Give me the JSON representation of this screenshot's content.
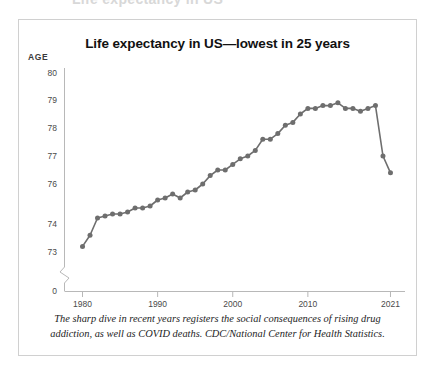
{
  "bleed": {
    "clipped_heading": "Life expectancy in US"
  },
  "figure": {
    "title": "Life expectancy in US—lowest in 25 years",
    "axis_unit_label": "AGE",
    "caption": "The sharp dive in recent years registers the social consequences of rising drug addiction, as well as COVID deaths. CDC/National Center for Health Statistics."
  },
  "colors": {
    "line": "#6e6e6e",
    "marker": "#6e6e6e",
    "axis": "#b8b8b8",
    "frame": "#d0d0d0",
    "title_text": "#111111",
    "tick_text": "#4a4a4a"
  },
  "chart_data": {
    "type": "line",
    "title": "Life expectancy in US—lowest in 25 years",
    "xlabel": "",
    "ylabel": "AGE",
    "ylim": [
      72.8,
      80.2
    ],
    "xlim": [
      1979,
      2022
    ],
    "grid": false,
    "legend": null,
    "axis_break": true,
    "axis_break_note": "y-axis broken between 0 and 73",
    "y_tick_labels": [
      "80",
      "79",
      "78",
      "77",
      "76",
      "74",
      "73",
      "0"
    ],
    "y_tick_values": [
      80,
      79,
      78,
      77,
      76,
      74,
      73,
      0
    ],
    "x_tick_labels": [
      "1980",
      "1990",
      "2000",
      "2010",
      "2021"
    ],
    "x_tick_values": [
      1980,
      1990,
      2000,
      2010,
      2021
    ],
    "series": [
      {
        "name": "US life expectancy at birth (years)",
        "x": [
          1980,
          1981,
          1982,
          1983,
          1984,
          1985,
          1986,
          1987,
          1988,
          1989,
          1990,
          1991,
          1992,
          1993,
          1994,
          1995,
          1996,
          1997,
          1998,
          1999,
          2000,
          2001,
          2002,
          2003,
          2004,
          2005,
          2006,
          2007,
          2008,
          2009,
          2010,
          2011,
          2012,
          2013,
          2014,
          2015,
          2016,
          2017,
          2018,
          2019,
          2020,
          2021
        ],
        "values": [
          73.2,
          73.6,
          74.3,
          74.4,
          74.5,
          74.5,
          74.6,
          74.8,
          74.8,
          74.9,
          75.2,
          75.3,
          75.5,
          75.3,
          75.6,
          75.7,
          76.0,
          76.3,
          76.5,
          76.5,
          76.7,
          76.9,
          77.0,
          77.2,
          77.6,
          77.6,
          77.8,
          78.1,
          78.2,
          78.5,
          78.7,
          78.7,
          78.8,
          78.8,
          78.9,
          78.7,
          78.7,
          78.6,
          78.7,
          78.8,
          77.0,
          76.4
        ]
      }
    ]
  }
}
